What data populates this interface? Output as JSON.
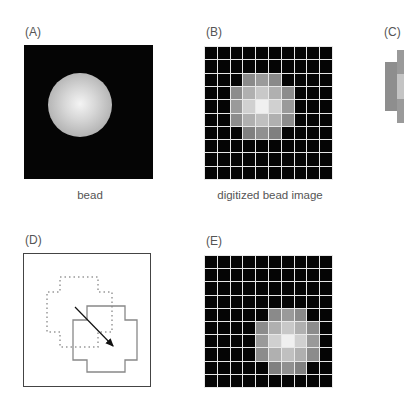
{
  "panels": {
    "A": {
      "label": "(A)",
      "caption": "bead",
      "bead": {
        "cx": 80,
        "cy": 105,
        "r": 32
      }
    },
    "B": {
      "label": "(B)",
      "caption": "digitized bead image",
      "grid": {
        "rows": 10,
        "cols": 10,
        "x": 204,
        "y": 46,
        "w": 129,
        "h": 134
      },
      "lit_cells": [
        {
          "r": 2,
          "c": 3,
          "v": "#8a8a8a"
        },
        {
          "r": 2,
          "c": 4,
          "v": "#9a9a9a"
        },
        {
          "r": 2,
          "c": 5,
          "v": "#8a8a8a"
        },
        {
          "r": 3,
          "c": 2,
          "v": "#8c8c8c"
        },
        {
          "r": 3,
          "c": 3,
          "v": "#b0b0b0"
        },
        {
          "r": 3,
          "c": 4,
          "v": "#c8c8c8"
        },
        {
          "r": 3,
          "c": 5,
          "v": "#b0b0b0"
        },
        {
          "r": 3,
          "c": 6,
          "v": "#8c8c8c"
        },
        {
          "r": 4,
          "c": 2,
          "v": "#9a9a9a"
        },
        {
          "r": 4,
          "c": 3,
          "v": "#d0d0d0"
        },
        {
          "r": 4,
          "c": 4,
          "v": "#f0f0f0"
        },
        {
          "r": 4,
          "c": 5,
          "v": "#d0d0d0"
        },
        {
          "r": 4,
          "c": 6,
          "v": "#9a9a9a"
        },
        {
          "r": 5,
          "c": 2,
          "v": "#8c8c8c"
        },
        {
          "r": 5,
          "c": 3,
          "v": "#b0b0b0"
        },
        {
          "r": 5,
          "c": 4,
          "v": "#c0c0c0"
        },
        {
          "r": 5,
          "c": 5,
          "v": "#b0b0b0"
        },
        {
          "r": 5,
          "c": 6,
          "v": "#8c8c8c"
        },
        {
          "r": 6,
          "c": 3,
          "v": "#808080"
        },
        {
          "r": 6,
          "c": 4,
          "v": "#909090"
        },
        {
          "r": 6,
          "c": 5,
          "v": "#808080"
        }
      ]
    },
    "C": {
      "label": "(C)"
    },
    "D": {
      "label": "(D)",
      "dotted_shape": "60,277 98,277 98,292 112,292 112,332 98,332 98,347 60,347 60,332 47,332 47,292 60,292",
      "solid_shape": "87,306 125,306 125,320 137,320 137,360 125,360 125,372 87,372 87,360 73,360 73,320 87,320",
      "arrow": {
        "x1": 75,
        "y1": 307,
        "x2": 113,
        "y2": 346
      }
    },
    "E": {
      "label": "(E)",
      "grid": {
        "rows": 10,
        "cols": 10,
        "x": 204,
        "y": 255,
        "w": 129,
        "h": 133
      },
      "shift": {
        "dr": 2,
        "dc": 2
      }
    }
  }
}
